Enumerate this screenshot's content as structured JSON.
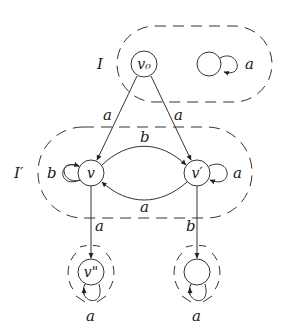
{
  "diagram": {
    "type": "automaton-graph",
    "regions": [
      {
        "id": "I",
        "label": "I"
      },
      {
        "id": "I_prime",
        "label": "I′"
      }
    ],
    "nodes": [
      {
        "id": "v0",
        "label": "v₀",
        "region": "I"
      },
      {
        "id": "u_top",
        "label": "",
        "region": "I"
      },
      {
        "id": "v",
        "label": "v",
        "region": "I_prime"
      },
      {
        "id": "v_prime",
        "label": "v′",
        "region": "I_prime"
      },
      {
        "id": "v_dprime",
        "label": "v\"",
        "region": "singleton-left"
      },
      {
        "id": "u_bottom",
        "label": "",
        "region": "singleton-right"
      }
    ],
    "edges": [
      {
        "from": "u_top",
        "to": "u_top",
        "label": "a"
      },
      {
        "from": "v0",
        "to": "v",
        "label": "a"
      },
      {
        "from": "v0",
        "to": "v_prime",
        "label": "a"
      },
      {
        "from": "v",
        "to": "v",
        "label": "b"
      },
      {
        "from": "v_prime",
        "to": "v_prime",
        "label": "a"
      },
      {
        "from": "v",
        "to": "v_prime",
        "label": "b"
      },
      {
        "from": "v_prime",
        "to": "v",
        "label": "a"
      },
      {
        "from": "v",
        "to": "v_dprime",
        "label": "a"
      },
      {
        "from": "v_prime",
        "to": "u_bottom",
        "label": "b"
      },
      {
        "from": "v_dprime",
        "to": "v_dprime",
        "label": "a"
      },
      {
        "from": "u_bottom",
        "to": "u_bottom",
        "label": "a"
      }
    ]
  }
}
